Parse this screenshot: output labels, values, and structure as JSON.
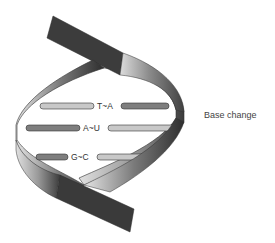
{
  "diagram": {
    "type": "dna-double-helix",
    "side_label": "Base change",
    "base_pairs": [
      {
        "label": "T~A",
        "left_base": "T",
        "right_base": "A"
      },
      {
        "label": "A~U",
        "left_base": "A",
        "right_base": "U"
      },
      {
        "label": "G~C",
        "left_base": "G",
        "right_base": "C"
      }
    ],
    "colors": {
      "strand_dark": "#3a3a3a",
      "strand_mid": "#8a8a8a",
      "strand_light": "#d8d8d8",
      "rung_dark": "#7a7a7a",
      "rung_light": "#c4c4c4",
      "outline": "#333333",
      "background": "#ffffff"
    }
  }
}
